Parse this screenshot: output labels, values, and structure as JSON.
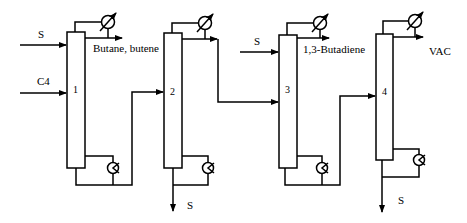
{
  "diagram": {
    "columns": [
      {
        "id": "1",
        "label": "1"
      },
      {
        "id": "2",
        "label": "2"
      },
      {
        "id": "3",
        "label": "3"
      },
      {
        "id": "4",
        "label": "4"
      }
    ],
    "streams": {
      "solvent_in_1": "S",
      "feed_in_1": "C4",
      "top_product_1": "Butane, butene",
      "bottom_out_2": "S",
      "solvent_in_3": "S",
      "top_product_3": "1,3-Butadiene",
      "top_product_4": "VAC",
      "bottom_out_4": "S"
    },
    "equipment": {
      "condenser": "condenser-icon",
      "reboiler": "reboiler-icon"
    }
  }
}
